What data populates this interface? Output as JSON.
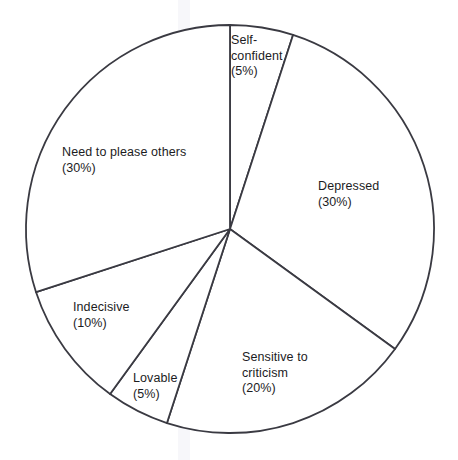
{
  "chart_data": {
    "type": "pie",
    "title": "",
    "subtitle": "",
    "xlabel": "",
    "ylabel": "",
    "legend_position": "none",
    "grid": false,
    "labels_inside": true,
    "start_angle_deg": 0,
    "direction": "clockwise",
    "categories": [
      "Self-confident",
      "Depressed",
      "Sensitive to criticism",
      "Lovable",
      "Indecisive",
      "Need to please others"
    ],
    "values": [
      5,
      30,
      20,
      5,
      10,
      30
    ],
    "unit": "%",
    "slices": [
      {
        "name": "Self-confident",
        "label_text": "Self-\nconfident\n(5%)",
        "value": 5,
        "percent_text": "(5%)",
        "start_deg": 0,
        "end_deg": 18
      },
      {
        "name": "Depressed",
        "label_text": "Depressed\n(30%)",
        "value": 30,
        "percent_text": "(30%)",
        "start_deg": 18,
        "end_deg": 126
      },
      {
        "name": "Sensitive to criticism",
        "label_text": "Sensitive to\ncriticism\n(20%)",
        "value": 20,
        "percent_text": "(20%)",
        "start_deg": 126,
        "end_deg": 198
      },
      {
        "name": "Lovable",
        "label_text": "Lovable\n(5%)",
        "value": 5,
        "percent_text": "(5%)",
        "start_deg": 198,
        "end_deg": 216
      },
      {
        "name": "Indecisive",
        "label_text": "Indecisive\n(10%)",
        "value": 10,
        "percent_text": "(10%)",
        "start_deg": 216,
        "end_deg": 252
      },
      {
        "name": "Need to please others",
        "label_text": "Need to please others\n(30%)",
        "value": 30,
        "percent_text": "(30%)",
        "start_deg": 252,
        "end_deg": 360
      }
    ],
    "style": {
      "fill": "#ffffff",
      "stroke": "#3a3a42",
      "stroke_width": 1.8,
      "text_color": "#1c1c1e",
      "background": "#ffffff"
    },
    "geometry": {
      "center_x": 230,
      "center_y": 229,
      "radius": 204
    }
  }
}
